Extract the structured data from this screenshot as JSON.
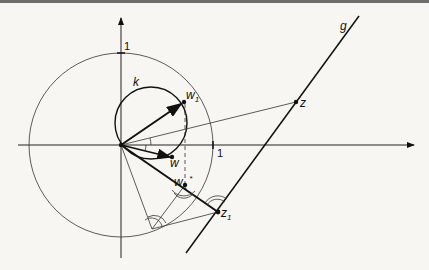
{
  "figure": {
    "type": "geometric-diagram"
  },
  "labels": {
    "line_g": "g",
    "circle_k": "k",
    "point_z": "z",
    "point_z1": "z",
    "point_z1_sub": "1",
    "point_w": "w",
    "point_w1": "w",
    "point_w1_sub": "1",
    "point_w1star": "w",
    "point_w1star_sub": "1",
    "point_w1star_sup": "*",
    "unit_x": "1",
    "unit_y": "1"
  },
  "colors": {
    "background": "#f7f6f2",
    "ink": "#111111",
    "thin": "#333333"
  }
}
